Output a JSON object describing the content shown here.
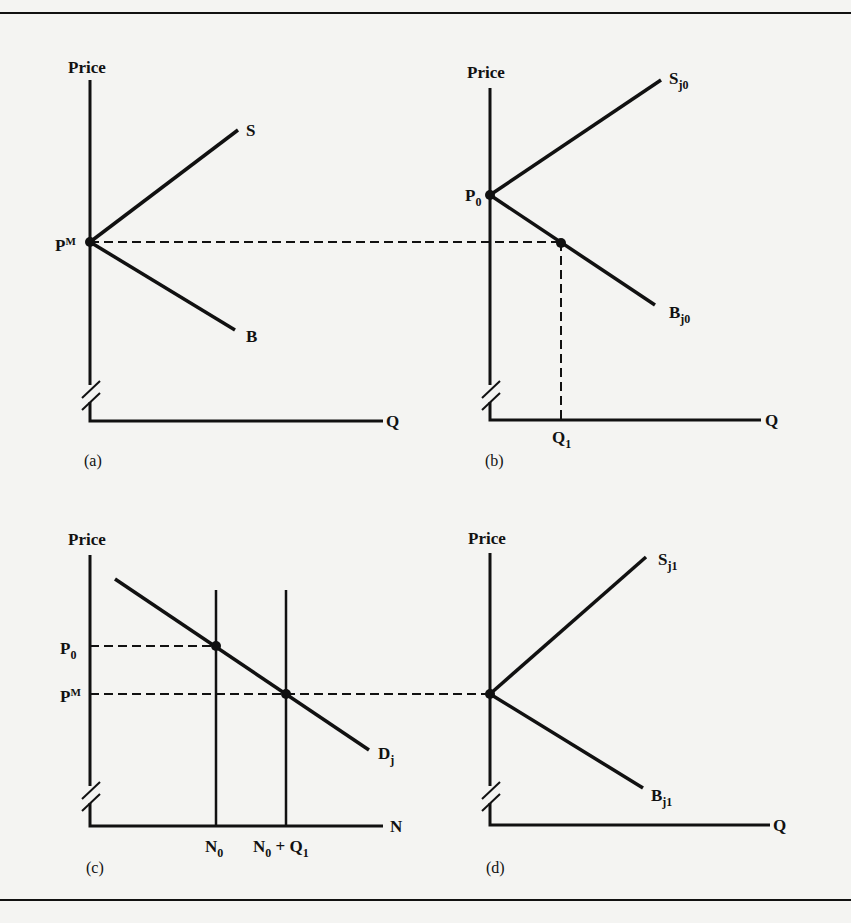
{
  "figure": {
    "panels": [
      {
        "id": "a",
        "caption": "(a)",
        "y_axis_label": "Price",
        "x_axis_label": "Q",
        "curves": [
          {
            "name": "S",
            "label": "S"
          },
          {
            "name": "B",
            "label": "B"
          }
        ],
        "points": [
          {
            "label": "P",
            "sup": "M"
          }
        ]
      },
      {
        "id": "b",
        "caption": "(b)",
        "y_axis_label": "Price",
        "x_axis_label": "Q",
        "curves": [
          {
            "name": "Sj0",
            "label": "S",
            "sub": "j0"
          },
          {
            "name": "Bj0",
            "label": "B",
            "sub": "j0"
          }
        ],
        "points": [
          {
            "label": "P",
            "sub": "0"
          }
        ],
        "x_marks": [
          {
            "label": "Q",
            "sub": "1"
          }
        ]
      },
      {
        "id": "c",
        "caption": "(c)",
        "y_axis_label": "Price",
        "x_axis_label": "N",
        "curves": [
          {
            "name": "Dj",
            "label": "D",
            "sub": "j"
          }
        ],
        "points": [
          {
            "label": "P",
            "sub": "0"
          },
          {
            "label": "P",
            "sup": "M"
          }
        ],
        "x_marks": [
          {
            "label": "N",
            "sub": "0"
          },
          {
            "label": "N",
            "sub": "0",
            "suffix": " + Q",
            "suffix_sub": "1"
          }
        ]
      },
      {
        "id": "d",
        "caption": "(d)",
        "y_axis_label": "Price",
        "x_axis_label": "Q",
        "curves": [
          {
            "name": "Sj1",
            "label": "S",
            "sub": "j1"
          },
          {
            "name": "Bj1",
            "label": "B",
            "sub": "j1"
          }
        ]
      }
    ]
  }
}
